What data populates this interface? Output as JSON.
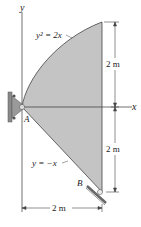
{
  "diagram": {
    "type": "statics-plate-figure",
    "colors": {
      "plate_fill": "#c4c4c4",
      "line": "#333333",
      "support": "#8a8a8a",
      "background": "#ffffff"
    },
    "axes": {
      "x_label": "x",
      "y_label": "y"
    },
    "curves": {
      "upper": "y² = 2x",
      "lower": "y = −x"
    },
    "points": {
      "a": "A",
      "b": "B"
    },
    "dimensions": {
      "upper_height": "2 m",
      "lower_height": "2 m",
      "width": "2 m"
    }
  }
}
